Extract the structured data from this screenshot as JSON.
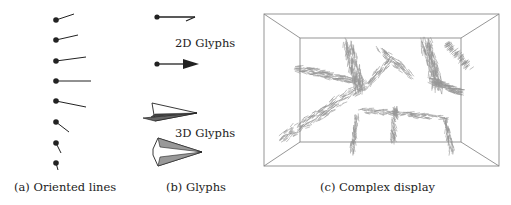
{
  "figure": {
    "panels": [
      {
        "id": "a",
        "caption": "(a) Oriented lines",
        "glyphs": [
          {
            "dot": [
              56,
              20
            ],
            "tip": [
              74,
              14
            ]
          },
          {
            "dot": [
              56,
              40
            ],
            "tip": [
              78,
              35
            ]
          },
          {
            "dot": [
              56,
              61
            ],
            "tip": [
              86,
              57
            ]
          },
          {
            "dot": [
              56,
              81
            ],
            "tip": [
              91,
              81
            ]
          },
          {
            "dot": [
              56,
              101
            ],
            "tip": [
              86,
              107
            ]
          },
          {
            "dot": [
              56,
              122
            ],
            "tip": [
              69,
              132
            ]
          },
          {
            "dot": [
              56,
              143
            ],
            "tip": [
              61,
              153
            ]
          },
          {
            "dot": [
              56,
              163
            ],
            "tip": [
              58,
              170
            ]
          }
        ]
      },
      {
        "id": "b",
        "caption": "(b) Glyphs",
        "labels": {
          "glyphs_2d": "2D Glyphs",
          "glyphs_3d": "3D Glyphs"
        }
      },
      {
        "id": "c",
        "caption": "(c) Complex display"
      }
    ],
    "colors": {
      "ink": "#222222",
      "box_line": "#8a8a8a",
      "flow_glyph": "#8c8c8c",
      "glyph_fill": "#9a9a9a"
    }
  }
}
